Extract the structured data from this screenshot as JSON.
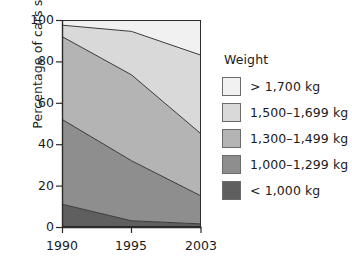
{
  "chart_data": {
    "type": "area",
    "title": "",
    "subtitle": "",
    "xlabel": "",
    "ylabel": "Percentage of cars sold",
    "categories": [
      "1990",
      "1995",
      "2003"
    ],
    "x": [
      1990,
      1995,
      2003
    ],
    "xtick_labels": [
      "1990",
      "1995",
      "2003"
    ],
    "ytick_labels": [
      "0",
      "20",
      "40",
      "60",
      "80",
      "100"
    ],
    "yticks": [
      0,
      20,
      40,
      60,
      80,
      100
    ],
    "ylim": [
      0,
      100
    ],
    "xlim": [
      1990,
      2003
    ],
    "stacked": true,
    "normalized_percent": true,
    "grid": false,
    "legend_position": "right",
    "legend_title": "Weight",
    "annotations": [],
    "series": [
      {
        "name": "< 1,000 kg",
        "color": "#5f5f5f",
        "values": [
          11,
          3,
          1.5
        ],
        "cumulative_top": [
          11,
          3,
          1.5
        ]
      },
      {
        "name": "1,000–1,299 kg",
        "color": "#8e8e8e",
        "values": [
          41,
          29,
          13.5
        ],
        "cumulative_top": [
          52,
          32,
          15
        ]
      },
      {
        "name": "1,300–1,499 kg",
        "color": "#b4b4b4",
        "values": [
          40,
          41.5,
          30
        ],
        "cumulative_top": [
          92,
          73.5,
          45
        ]
      },
      {
        "name": "1,500–1,699 kg",
        "color": "#d9d9d9",
        "values": [
          5.5,
          21,
          38
        ],
        "cumulative_top": [
          97.5,
          94.5,
          83
        ]
      },
      {
        "name": "> 1,700 kg",
        "color": "#f1f1f1",
        "values": [
          2.5,
          5.5,
          17
        ],
        "cumulative_top": [
          100,
          100,
          100
        ]
      }
    ]
  },
  "axes": {
    "y_title": "Percentage of cars sold",
    "y_ticks": [
      "100",
      "80",
      "60",
      "40",
      "20",
      "0"
    ],
    "x_ticks": [
      "1990",
      "1995",
      "2003"
    ]
  },
  "legend": {
    "title": "Weight",
    "items": [
      {
        "label": "> 1,700 kg",
        "color": "#f1f1f1"
      },
      {
        "label": "1,500–1,699 kg",
        "color": "#d9d9d9"
      },
      {
        "label": "1,300–1,499 kg",
        "color": "#b4b4b4"
      },
      {
        "label": "1,000–1,299 kg",
        "color": "#8e8e8e"
      },
      {
        "label": "< 1,000 kg",
        "color": "#5f5f5f"
      }
    ]
  },
  "style": {
    "axis_color": "#2b2b2b",
    "band_outline": "#3a3a3a",
    "background": "#ffffff"
  }
}
